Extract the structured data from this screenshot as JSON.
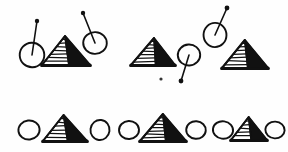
{
  "figure": {
    "title": "Hand-drawn shape sequence figure",
    "description": "Two rows of hand-drawn symbols: hatched pyramids and circles, some circles carrying a straight stem ending in a filled dot.",
    "width": 288,
    "height": 152,
    "background_color": "#fefefe",
    "ink_color": "#111111",
    "rows": [
      {
        "name": "top-row",
        "label": "Top row",
        "items": [
          {
            "type": "balloon",
            "label": "circle with stem",
            "cx": 32,
            "cy": 55,
            "r": 13,
            "stem_dx": 5,
            "stem_dy": -34,
            "dot_r": 2.2
          },
          {
            "type": "pyramid",
            "label": "hatched pyramid",
            "cx": 66,
            "base_y": 65,
            "half_width": 24,
            "height": 29
          },
          {
            "type": "balloon",
            "label": "circle with stem",
            "cx": 95,
            "cy": 43,
            "r": 12,
            "stem_dx": -12,
            "stem_dy": -30,
            "dot_r": 2.2
          },
          {
            "type": "pyramid",
            "label": "hatched pyramid",
            "cx": 153,
            "base_y": 65,
            "half_width": 22,
            "height": 27
          },
          {
            "type": "balloon",
            "label": "circle with stem",
            "cx": 189,
            "cy": 55,
            "r": 11,
            "stem_dx": -8,
            "stem_dy": 26,
            "dot_r": 2.4
          },
          {
            "type": "balloon",
            "label": "circle with stem",
            "cx": 215,
            "cy": 35,
            "r": 12,
            "stem_dx": 12,
            "stem_dy": -27,
            "dot_r": 2.4
          },
          {
            "type": "pyramid",
            "label": "hatched pyramid",
            "cx": 245,
            "base_y": 68,
            "half_width": 23,
            "height": 28
          }
        ]
      },
      {
        "name": "bottom-row",
        "label": "Bottom row",
        "items": [
          {
            "type": "circle",
            "label": "plain circle",
            "cx": 29,
            "cy": 130,
            "r": 10
          },
          {
            "type": "pyramid",
            "label": "hatched pyramid",
            "cx": 65,
            "base_y": 141,
            "half_width": 22,
            "height": 26
          },
          {
            "type": "circle",
            "label": "plain circle",
            "cx": 100,
            "cy": 130,
            "r": 10
          },
          {
            "type": "circle",
            "label": "plain circle",
            "cx": 129,
            "cy": 130,
            "r": 10
          },
          {
            "type": "pyramid",
            "label": "hatched pyramid",
            "cx": 163,
            "base_y": 141,
            "half_width": 23,
            "height": 27
          },
          {
            "type": "circle",
            "label": "plain circle",
            "cx": 196,
            "cy": 130,
            "r": 10
          },
          {
            "type": "circle",
            "label": "plain circle",
            "cx": 223,
            "cy": 130,
            "r": 10
          },
          {
            "type": "pyramid",
            "label": "hatched pyramid",
            "cx": 249,
            "base_y": 140,
            "half_width": 18,
            "height": 23
          },
          {
            "type": "circle",
            "label": "plain circle",
            "cx": 275,
            "cy": 130,
            "r": 9
          }
        ]
      }
    ],
    "stray_marks": [
      {
        "name": "speck",
        "x": 161,
        "y": 79,
        "r": 1.6
      }
    ]
  }
}
